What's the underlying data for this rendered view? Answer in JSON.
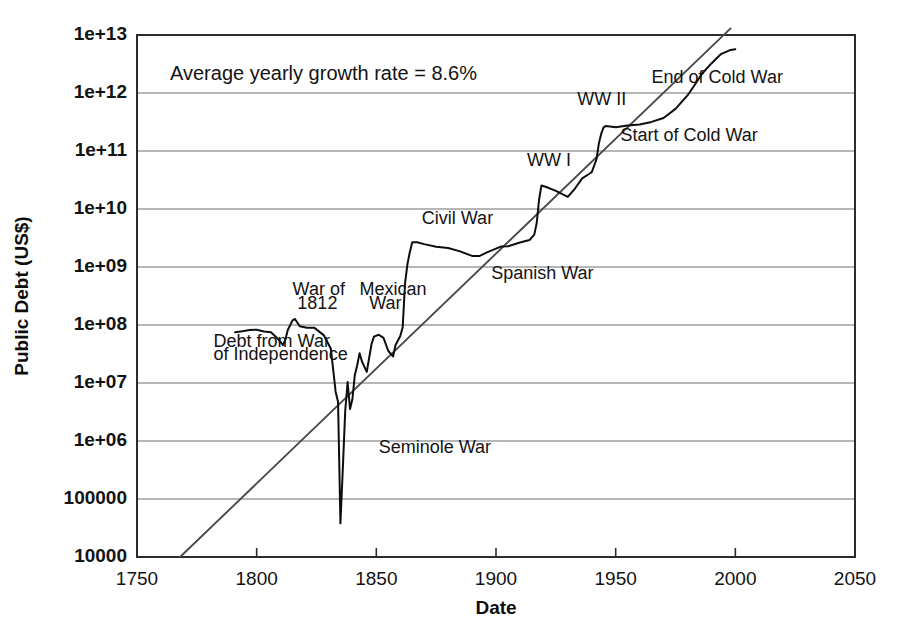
{
  "chart_data": {
    "type": "line",
    "title": "",
    "xlabel": "Date",
    "ylabel": "Public Debt (US$)",
    "yscale": "log",
    "xlim": [
      1750,
      2050
    ],
    "ylim": [
      10000,
      10000000000000
    ],
    "grid": true,
    "legend": "none",
    "xticks": [
      "1750",
      "1800",
      "1850",
      "1900",
      "1950",
      "2000",
      "2050"
    ],
    "xtick_values": [
      1750,
      1800,
      1850,
      1900,
      1950,
      2000,
      2050
    ],
    "yticks": [
      "10000",
      "100000",
      "1e+06",
      "1e+07",
      "1e+08",
      "1e+09",
      "1e+10",
      "1e+11",
      "1e+12",
      "1e+13"
    ],
    "ytick_values": [
      10000,
      100000,
      1000000,
      10000000,
      100000000,
      1000000000,
      10000000000,
      100000000000,
      1000000000000,
      10000000000000
    ],
    "annotation_text": "Average yearly growth rate = 8.6%",
    "growth_rate_percent": 8.6,
    "series": [
      {
        "name": "US Public Debt",
        "x": [
          1791,
          1794,
          1797,
          1800,
          1803,
          1806,
          1809,
          1811,
          1812,
          1813,
          1815,
          1816,
          1818,
          1821,
          1824,
          1828,
          1831,
          1833,
          1834,
          1835,
          1836,
          1837,
          1838,
          1839,
          1840,
          1841,
          1842,
          1843,
          1844,
          1846,
          1848,
          1849,
          1851,
          1853,
          1855,
          1857,
          1858,
          1860,
          1861,
          1862,
          1863,
          1864,
          1865,
          1867,
          1870,
          1875,
          1880,
          1885,
          1890,
          1893,
          1896,
          1899,
          1902,
          1905,
          1910,
          1914,
          1916,
          1917,
          1918,
          1919,
          1921,
          1925,
          1930,
          1933,
          1936,
          1940,
          1942,
          1943,
          1944,
          1945,
          1946,
          1950,
          1955,
          1960,
          1965,
          1970,
          1975,
          1980,
          1983,
          1986,
          1990,
          1994,
          1998,
          2000
        ],
        "y": [
          75000000,
          78000000,
          82000000,
          83000000,
          77000000,
          75000000,
          57000000,
          45000000,
          56000000,
          82000000,
          120000000,
          127000000,
          95000000,
          90000000,
          90000000,
          67000000,
          39000000,
          7000000,
          4760000,
          38000,
          337000,
          3300000,
          10400000,
          3570000,
          5250000,
          13590000,
          20200000,
          32700000,
          23460000,
          15550000,
          47000000,
          63000000,
          68000000,
          59800000,
          35600000,
          28700000,
          44900000,
          64800000,
          90500000,
          524000000,
          1119000000,
          1815000000,
          2680000000,
          2678000000,
          2480000000,
          2230000000,
          2120000000,
          1860000000,
          1552000000,
          1545000000,
          1770000000,
          1991000000,
          2249000000,
          2274000000,
          2652000000,
          2912000000,
          3609000000,
          5717000000,
          14592000000,
          25480000000,
          23977000000,
          20516000000,
          16185000000,
          22539000000,
          33779000000,
          42968000000,
          72422000000,
          136696000000,
          201003000000,
          258682000000,
          269422000000,
          257357000000,
          274366000000,
          286331000000,
          317274000000,
          370919000000,
          533189000000,
          907701000000,
          1377210000000,
          2125303000000,
          3233313000000,
          4692750000000,
          5526193000000,
          5674178000000
        ]
      },
      {
        "name": "Exponential trend (8.6% per year)",
        "type": "trend",
        "x": [
          1768,
          1998
        ],
        "y": [
          10000,
          13000000000000
        ]
      }
    ],
    "annotations": [
      {
        "label": "Average yearly growth rate = 8.6%",
        "x": 1770,
        "y": 3000000000000,
        "role": "growth-rate-note"
      },
      {
        "label": "Debt from War",
        "x": 1782,
        "y": 42000000,
        "role": "event-label"
      },
      {
        "label": "of Independence",
        "x": 1782,
        "y": 25000000,
        "role": "event-label"
      },
      {
        "label": "War of",
        "x": 1815,
        "y": 330000000,
        "role": "event-label"
      },
      {
        "label": "1812",
        "x": 1817,
        "y": 190000000,
        "role": "event-label"
      },
      {
        "label": "Mexican",
        "x": 1843,
        "y": 330000000,
        "role": "event-label"
      },
      {
        "label": "War",
        "x": 1847,
        "y": 190000000,
        "role": "event-label"
      },
      {
        "label": "Seminole War",
        "x": 1851,
        "y": 620000,
        "role": "event-label"
      },
      {
        "label": "Civil War",
        "x": 1869,
        "y": 5500000000,
        "role": "event-label"
      },
      {
        "label": "Spanish War",
        "x": 1898,
        "y": 620000000,
        "role": "event-label"
      },
      {
        "label": "WW I",
        "x": 1913,
        "y": 55000000000,
        "role": "event-label"
      },
      {
        "label": "WW II",
        "x": 1934,
        "y": 620000000000,
        "role": "event-label"
      },
      {
        "label": "Start of Cold War",
        "x": 1952,
        "y": 150000000000,
        "role": "event-label"
      },
      {
        "label": "End of Cold War",
        "x": 1965,
        "y": 1500000000000,
        "role": "event-label"
      }
    ]
  }
}
